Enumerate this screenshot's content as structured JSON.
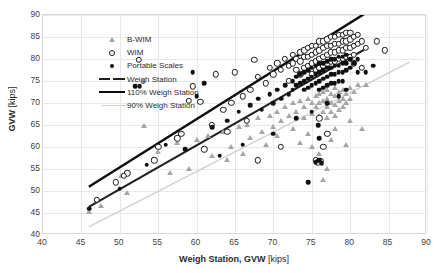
{
  "chart": {
    "type": "scatter",
    "title": "",
    "xlabel_main": "Weigh Station, GVW",
    "xlabel_unit": "[kips]",
    "ylabel_main": "GVW",
    "ylabel_unit": "[kips]",
    "xlim": [
      40,
      90
    ],
    "ylim": [
      40,
      90
    ],
    "xticks": [
      40,
      45,
      50,
      55,
      60,
      65,
      70,
      75,
      80,
      85,
      90
    ],
    "yticks": [
      40,
      45,
      50,
      55,
      60,
      65,
      70,
      75,
      80,
      85,
      90
    ],
    "grid": true,
    "legend_position": "top-left"
  },
  "legend": {
    "items": [
      {
        "label": "B-WIM",
        "marker": "triangle-gray",
        "color": "#a6a6a6"
      },
      {
        "label": "WIM",
        "marker": "circle-open",
        "color": "#1a1a1a"
      },
      {
        "label": "Portable Scales",
        "marker": "circle-filled",
        "color": "#101010"
      },
      {
        "label": "Weigh Station",
        "marker": "line-dark",
        "color": "#1f1f1f"
      },
      {
        "label": "110% Weigh Station",
        "marker": "line-thick-black",
        "color": "#0d0d0d"
      },
      {
        "label": "90% Weigh Station",
        "marker": "line-light-gray",
        "color": "#d2d2d2"
      }
    ]
  },
  "chart_data": {
    "type": "scatter",
    "title": "",
    "xlabel": "Weigh Station, GVW [kips]",
    "ylabel": "GVW [kips]",
    "xlim": [
      40,
      90
    ],
    "ylim": [
      40,
      90
    ],
    "xticks": [
      40,
      45,
      50,
      55,
      60,
      65,
      70,
      75,
      80,
      85,
      90
    ],
    "yticks": [
      40,
      45,
      50,
      55,
      60,
      65,
      70,
      75,
      80,
      85,
      90
    ],
    "grid": true,
    "legend": [
      "B-WIM",
      "WIM",
      "Portable Scales",
      "Weigh Station",
      "110% Weigh Station",
      "90% Weigh Station"
    ],
    "reference_lines": [
      {
        "name": "Weigh Station",
        "slope": 1.0,
        "intercept": 0,
        "x_range": [
          46,
          82
        ],
        "color": "#1f1f1f",
        "width": 2.2
      },
      {
        "name": "110% Weigh Station",
        "slope": 1.1,
        "intercept": 0,
        "x_range": [
          46,
          82
        ],
        "color": "#0d0d0d",
        "width": 2.4
      },
      {
        "name": "90% Weigh Station",
        "slope": 0.9,
        "intercept": 0,
        "x_range": [
          46,
          88
        ],
        "color": "#d2d2d2",
        "width": 1.6
      }
    ],
    "series": [
      {
        "name": "B-WIM",
        "marker": "triangle",
        "color": "#a6a6a6",
        "points": [
          [
            46.0,
            45.2
          ],
          [
            50.2,
            53.3
          ],
          [
            53.0,
            75.0
          ],
          [
            53.2,
            64.8
          ],
          [
            55.0,
            58.8
          ],
          [
            57.5,
            61.0
          ],
          [
            60.0,
            61.5
          ],
          [
            61.5,
            62.5
          ],
          [
            62.0,
            58.0
          ],
          [
            63.5,
            63.5
          ],
          [
            64.5,
            60.0
          ],
          [
            65.5,
            64.5
          ],
          [
            66.5,
            65.0
          ],
          [
            67.0,
            62.0
          ],
          [
            68.0,
            66.5
          ],
          [
            68.5,
            63.5
          ],
          [
            69.5,
            67.0
          ],
          [
            70.0,
            64.5
          ],
          [
            70.5,
            68.0
          ],
          [
            71.0,
            66.0
          ],
          [
            71.5,
            69.0
          ],
          [
            72.0,
            67.0
          ],
          [
            72.5,
            70.0
          ],
          [
            73.0,
            68.0
          ],
          [
            73.5,
            70.5
          ],
          [
            74.0,
            69.0
          ],
          [
            74.0,
            66.5
          ],
          [
            74.5,
            71.0
          ],
          [
            75.0,
            70.0
          ],
          [
            75.0,
            67.5
          ],
          [
            75.5,
            71.5
          ],
          [
            75.5,
            69.0
          ],
          [
            76.0,
            72.0
          ],
          [
            76.0,
            70.0
          ],
          [
            76.0,
            67.0
          ],
          [
            76.5,
            72.5
          ],
          [
            76.5,
            70.5
          ],
          [
            76.5,
            68.0
          ],
          [
            77.0,
            73.0
          ],
          [
            77.0,
            71.0
          ],
          [
            77.0,
            69.0
          ],
          [
            77.0,
            66.5
          ],
          [
            77.5,
            72.0
          ],
          [
            77.5,
            70.0
          ],
          [
            77.5,
            68.0
          ],
          [
            78.0,
            73.5
          ],
          [
            78.0,
            71.5
          ],
          [
            78.0,
            69.5
          ],
          [
            78.0,
            67.0
          ],
          [
            78.5,
            72.5
          ],
          [
            78.5,
            70.5
          ],
          [
            78.5,
            68.5
          ],
          [
            79.0,
            73.0
          ],
          [
            79.0,
            71.0
          ],
          [
            79.0,
            69.0
          ],
          [
            79.5,
            72.0
          ],
          [
            79.5,
            70.0
          ],
          [
            80.0,
            73.5
          ],
          [
            80.0,
            71.0
          ],
          [
            80.5,
            72.5
          ],
          [
            81.0,
            74.0
          ],
          [
            75.0,
            60.0
          ],
          [
            76.0,
            58.5
          ],
          [
            76.5,
            52.5
          ],
          [
            77.5,
            61.5
          ],
          [
            79.5,
            60.5
          ],
          [
            81.5,
            64.0
          ],
          [
            82.0,
            74.0
          ],
          [
            74.5,
            63.0
          ],
          [
            73.5,
            61.0
          ],
          [
            72.5,
            64.0
          ],
          [
            70.5,
            62.5
          ],
          [
            69.0,
            60.5
          ],
          [
            66.0,
            58.5
          ],
          [
            64.0,
            57.0
          ],
          [
            59.0,
            55.0
          ],
          [
            56.5,
            54.0
          ],
          [
            51.0,
            49.5
          ],
          [
            47.5,
            46.5
          ],
          [
            80.0,
            66.0
          ],
          [
            78.0,
            64.0
          ],
          [
            75.5,
            56.5
          ],
          [
            77.0,
            55.0
          ]
        ]
      },
      {
        "name": "WIM",
        "marker": "circle-open",
        "color": "#1a1a1a",
        "points": [
          [
            52.5,
            79.8
          ],
          [
            59.5,
            73.8
          ],
          [
            60.5,
            70.3
          ],
          [
            65.0,
            77.0
          ],
          [
            67.5,
            79.8
          ],
          [
            64.5,
            70.0
          ],
          [
            62.0,
            65.0
          ],
          [
            58.0,
            63.0
          ],
          [
            55.0,
            60.0
          ],
          [
            51.0,
            54.0
          ],
          [
            50.5,
            53.5
          ],
          [
            49.5,
            52.0
          ],
          [
            63.5,
            68.5
          ],
          [
            66.0,
            71.5
          ],
          [
            67.0,
            73.0
          ],
          [
            68.0,
            76.0
          ],
          [
            69.0,
            74.5
          ],
          [
            69.5,
            78.0
          ],
          [
            70.0,
            76.5
          ],
          [
            70.5,
            79.0
          ],
          [
            71.0,
            77.5
          ],
          [
            71.5,
            80.0
          ],
          [
            72.0,
            78.5
          ],
          [
            72.0,
            75.0
          ],
          [
            72.5,
            81.0
          ],
          [
            72.5,
            79.0
          ],
          [
            73.0,
            80.0
          ],
          [
            73.0,
            77.5
          ],
          [
            73.5,
            81.5
          ],
          [
            73.5,
            79.5
          ],
          [
            73.5,
            76.5
          ],
          [
            74.0,
            82.0
          ],
          [
            74.0,
            80.5
          ],
          [
            74.0,
            78.0
          ],
          [
            74.5,
            82.5
          ],
          [
            74.5,
            80.5
          ],
          [
            74.5,
            78.5
          ],
          [
            75.0,
            83.0
          ],
          [
            75.0,
            81.0
          ],
          [
            75.0,
            79.0
          ],
          [
            75.0,
            76.5
          ],
          [
            75.5,
            83.0
          ],
          [
            75.5,
            81.5
          ],
          [
            75.5,
            79.5
          ],
          [
            75.5,
            77.5
          ],
          [
            76.0,
            84.0
          ],
          [
            76.0,
            82.0
          ],
          [
            76.0,
            80.0
          ],
          [
            76.0,
            78.0
          ],
          [
            76.5,
            84.0
          ],
          [
            76.5,
            82.5
          ],
          [
            76.5,
            80.5
          ],
          [
            76.5,
            78.5
          ],
          [
            77.0,
            84.5
          ],
          [
            77.0,
            83.0
          ],
          [
            77.0,
            81.0
          ],
          [
            77.0,
            79.0
          ],
          [
            77.5,
            85.0
          ],
          [
            77.5,
            83.0
          ],
          [
            77.5,
            81.5
          ],
          [
            77.5,
            79.5
          ],
          [
            78.0,
            85.0
          ],
          [
            78.0,
            83.5
          ],
          [
            78.0,
            81.5
          ],
          [
            78.0,
            79.5
          ],
          [
            78.5,
            85.5
          ],
          [
            78.5,
            83.5
          ],
          [
            78.5,
            82.0
          ],
          [
            78.5,
            80.0
          ],
          [
            79.0,
            85.5
          ],
          [
            79.0,
            84.0
          ],
          [
            79.0,
            82.0
          ],
          [
            79.0,
            80.0
          ],
          [
            79.5,
            86.0
          ],
          [
            79.5,
            84.0
          ],
          [
            79.5,
            82.5
          ],
          [
            79.5,
            80.5
          ],
          [
            80.0,
            86.0
          ],
          [
            80.0,
            84.5
          ],
          [
            80.0,
            82.5
          ],
          [
            80.0,
            80.5
          ],
          [
            80.5,
            85.0
          ],
          [
            80.5,
            83.0
          ],
          [
            80.5,
            81.0
          ],
          [
            81.0,
            85.5
          ],
          [
            81.0,
            83.5
          ],
          [
            81.5,
            84.0
          ],
          [
            82.0,
            82.5
          ],
          [
            83.5,
            84.0
          ],
          [
            84.5,
            82.0
          ],
          [
            80.5,
            79.0
          ],
          [
            81.5,
            78.0
          ],
          [
            76.0,
            66.5
          ],
          [
            77.0,
            63.0
          ],
          [
            76.5,
            60.0
          ],
          [
            75.5,
            57.0
          ],
          [
            75.8,
            56.5
          ],
          [
            76.2,
            56.8
          ],
          [
            71.0,
            60.0
          ],
          [
            68.0,
            57.0
          ],
          [
            57.5,
            62.0
          ],
          [
            59.0,
            70.5
          ],
          [
            62.5,
            76.5
          ],
          [
            66.5,
            66.0
          ],
          [
            64.0,
            63.5
          ],
          [
            61.0,
            59.5
          ],
          [
            54.5,
            57.0
          ],
          [
            47.0,
            48.0
          ]
        ]
      },
      {
        "name": "Portable Scales",
        "marker": "circle-filled",
        "color": "#101010",
        "points": [
          [
            46.0,
            46.0
          ],
          [
            50.0,
            50.5
          ],
          [
            52.0,
            73.8
          ],
          [
            52.6,
            73.8
          ],
          [
            59.5,
            77.0
          ],
          [
            60.0,
            71.5
          ],
          [
            62.0,
            64.5
          ],
          [
            64.0,
            66.0
          ],
          [
            65.5,
            68.0
          ],
          [
            67.0,
            69.5
          ],
          [
            68.0,
            71.0
          ],
          [
            68.5,
            68.5
          ],
          [
            69.5,
            72.0
          ],
          [
            70.0,
            70.0
          ],
          [
            70.5,
            73.0
          ],
          [
            71.0,
            71.0
          ],
          [
            71.5,
            74.0
          ],
          [
            72.0,
            72.0
          ],
          [
            72.5,
            75.0
          ],
          [
            72.5,
            73.0
          ],
          [
            73.0,
            76.0
          ],
          [
            73.0,
            74.0
          ],
          [
            73.5,
            76.5
          ],
          [
            73.5,
            74.5
          ],
          [
            74.0,
            77.0
          ],
          [
            74.0,
            75.0
          ],
          [
            74.0,
            73.0
          ],
          [
            74.5,
            77.5
          ],
          [
            74.5,
            75.5
          ],
          [
            74.5,
            73.5
          ],
          [
            75.0,
            78.0
          ],
          [
            75.0,
            76.0
          ],
          [
            75.0,
            74.0
          ],
          [
            75.5,
            78.5
          ],
          [
            75.5,
            76.5
          ],
          [
            75.5,
            74.5
          ],
          [
            76.0,
            79.0
          ],
          [
            76.0,
            77.0
          ],
          [
            76.0,
            75.0
          ],
          [
            76.0,
            73.0
          ],
          [
            76.5,
            79.0
          ],
          [
            76.5,
            77.5
          ],
          [
            76.5,
            75.5
          ],
          [
            76.5,
            73.5
          ],
          [
            77.0,
            79.5
          ],
          [
            77.0,
            78.0
          ],
          [
            77.0,
            76.0
          ],
          [
            77.0,
            74.0
          ],
          [
            77.5,
            80.0
          ],
          [
            77.5,
            78.0
          ],
          [
            77.5,
            76.5
          ],
          [
            77.5,
            74.5
          ],
          [
            78.0,
            80.0
          ],
          [
            78.0,
            78.5
          ],
          [
            78.0,
            76.5
          ],
          [
            78.0,
            74.5
          ],
          [
            78.5,
            80.5
          ],
          [
            78.5,
            78.5
          ],
          [
            78.5,
            77.0
          ],
          [
            78.5,
            75.0
          ],
          [
            79.0,
            80.5
          ],
          [
            79.0,
            79.0
          ],
          [
            79.0,
            77.0
          ],
          [
            79.0,
            75.0
          ],
          [
            79.5,
            81.0
          ],
          [
            79.5,
            79.0
          ],
          [
            79.5,
            77.5
          ],
          [
            80.0,
            80.0
          ],
          [
            80.0,
            78.0
          ],
          [
            80.5,
            79.0
          ],
          [
            81.0,
            80.0
          ],
          [
            81.0,
            77.0
          ],
          [
            82.0,
            77.0
          ],
          [
            83.0,
            78.5
          ],
          [
            79.5,
            73.0
          ],
          [
            78.5,
            71.5
          ],
          [
            77.0,
            70.0
          ],
          [
            75.0,
            68.0
          ],
          [
            73.0,
            66.5
          ],
          [
            70.0,
            63.0
          ],
          [
            66.0,
            60.5
          ],
          [
            63.0,
            58.0
          ],
          [
            58.5,
            59.5
          ],
          [
            61.0,
            74.5
          ],
          [
            75.8,
            65.0
          ],
          [
            76.0,
            62.0
          ],
          [
            75.5,
            56.5
          ],
          [
            76.0,
            57.0
          ],
          [
            76.3,
            56.3
          ],
          [
            74.5,
            52.0
          ],
          [
            56.0,
            60.5
          ],
          [
            53.5,
            56.0
          ]
        ]
      }
    ]
  }
}
